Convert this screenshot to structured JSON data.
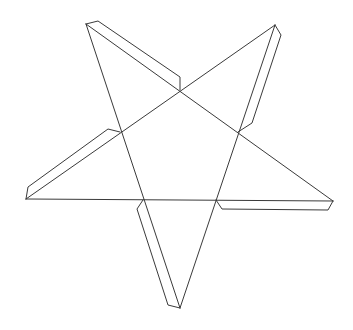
{
  "diagram": {
    "line_color": "#3a3a3a",
    "background": "#ffffff",
    "shape": "five-pointed star",
    "tab_count": 5
  }
}
